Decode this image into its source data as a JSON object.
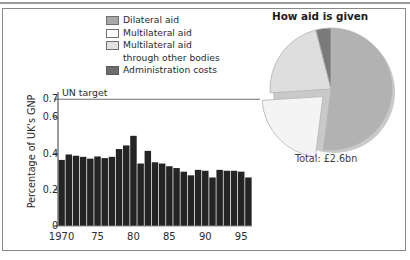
{
  "figure": {
    "frame_color": "#8a8a8a",
    "background": "#ffffff"
  },
  "legend": {
    "items": [
      {
        "label": "Dilateral aid",
        "swatch": "bilateral-swatch",
        "color": "#a8a8a8"
      },
      {
        "label": "Multilateral aid",
        "swatch": "multilateral-swatch",
        "color": "#ffffff"
      },
      {
        "label": "Multilateral aid",
        "label_cont": "through other bodies",
        "swatch": "multilateral-other-swatch",
        "color": "#e2e2e2"
      },
      {
        "label": "Administration costs",
        "swatch": "admin-swatch",
        "color": "#6d6d6d"
      }
    ]
  },
  "pie": {
    "title": "How aid is given",
    "total_label": "Total: £2.6bn"
  },
  "bars": {
    "un_target_label": "UN target"
  },
  "chart_data": [
    {
      "type": "bar",
      "title": "",
      "xlabel": "",
      "ylabel": "Percentage of UK's GNP",
      "ylim": [
        0,
        0.74
      ],
      "yticks": [
        0,
        0.2,
        0.4,
        0.6,
        0.7
      ],
      "ytick_labels": [
        "0",
        "0.2",
        "0.4",
        "0.6",
        "0.7"
      ],
      "xlim": [
        1969.5,
        1996.5
      ],
      "xticks": [
        1970,
        1975,
        1980,
        1985,
        1990,
        1995
      ],
      "xtick_labels": [
        "1970",
        "75",
        "80",
        "85",
        "90",
        "95"
      ],
      "grid": false,
      "bar_color": "#242424",
      "reference_line": {
        "label": "UN target",
        "value": 0.7,
        "color": "#6f6f6f"
      },
      "categories": [
        1970,
        1971,
        1972,
        1973,
        1974,
        1975,
        1976,
        1977,
        1978,
        1979,
        1980,
        1981,
        1982,
        1983,
        1984,
        1985,
        1986,
        1987,
        1988,
        1989,
        1990,
        1991,
        1992,
        1993,
        1994,
        1995,
        1996
      ],
      "values": [
        0.365,
        0.395,
        0.388,
        0.382,
        0.372,
        0.384,
        0.375,
        0.382,
        0.425,
        0.445,
        0.498,
        0.345,
        0.415,
        0.352,
        0.345,
        0.33,
        0.32,
        0.3,
        0.28,
        0.31,
        0.305,
        0.268,
        0.31,
        0.305,
        0.305,
        0.3,
        0.268
      ]
    },
    {
      "type": "pie",
      "title": "How aid is given",
      "legend_position": "upper-left",
      "annotation": "Total: £2.6bn",
      "labels": [
        "Dilateral aid",
        "Multilateral aid",
        "Multilateral aid through other bodies",
        "Administration costs"
      ],
      "values": [
        52,
        22,
        22,
        4
      ],
      "colors": [
        "#b2b2b2",
        "#f4f4f4",
        "#dedede",
        "#7a7a7a"
      ],
      "exploded": [
        "Multilateral aid"
      ]
    }
  ]
}
